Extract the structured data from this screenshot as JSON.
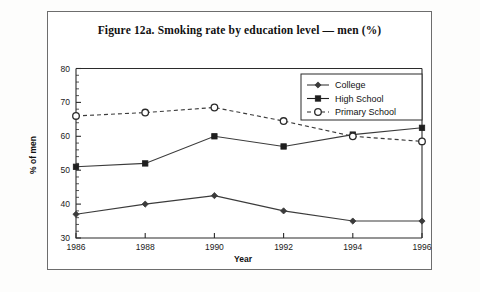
{
  "figure": {
    "title": "Figure 12a. Smoking rate by education level — men (%)"
  },
  "axes": {
    "x_title": "Year",
    "y_title": "% of men",
    "x_tick_labels": [
      "1986",
      "1988",
      "1990",
      "1992",
      "1994",
      "1996"
    ],
    "y_tick_labels": [
      "30",
      "40",
      "50",
      "60",
      "70",
      "80"
    ]
  },
  "legend": {
    "position": "top-right",
    "entries": [
      {
        "label": "College",
        "marker": "filled-diamond",
        "line": "solid"
      },
      {
        "label": "High School",
        "marker": "filled-square",
        "line": "solid"
      },
      {
        "label": "Primary School",
        "marker": "open-circle",
        "line": "dashed"
      }
    ]
  },
  "chart_data": {
    "type": "line",
    "title": "Figure 12a. Smoking rate by education level — men (%)",
    "xlabel": "Year",
    "ylabel": "% of men",
    "categories": [
      1986,
      1988,
      1990,
      1992,
      1994,
      1996
    ],
    "xlim": [
      1986,
      1996
    ],
    "ylim": [
      30,
      80
    ],
    "y_major_step": 10,
    "y_minor_step": 2,
    "grid": false,
    "legend_position": "top-right",
    "series": [
      {
        "name": "College",
        "marker": "filled-diamond",
        "line": "solid",
        "color": "#3b3b3b",
        "values": [
          37,
          40,
          42.5,
          38,
          35,
          35
        ]
      },
      {
        "name": "High School",
        "marker": "filled-square",
        "line": "solid",
        "color": "#1f1f1f",
        "values": [
          51,
          52,
          60,
          57,
          60.5,
          62.5
        ]
      },
      {
        "name": "Primary School",
        "marker": "open-circle",
        "line": "dashed",
        "color": "#2b2b2b",
        "values": [
          66,
          67,
          68.5,
          64.5,
          60,
          58.5
        ]
      }
    ]
  }
}
